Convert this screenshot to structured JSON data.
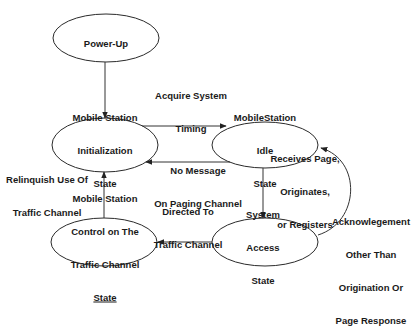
{
  "states": {
    "power_up": {
      "lines": [
        "Power-Up"
      ]
    },
    "init": {
      "lines": [
        "Mobile Station",
        "Initialization",
        "State"
      ]
    },
    "idle": {
      "lines": [
        "MobileStation",
        "Idle",
        "State"
      ]
    },
    "access": {
      "lines": [
        "System",
        "Access",
        "State"
      ]
    },
    "control": {
      "lines": [
        "Mobile Station",
        "Control on The",
        "Traffic Channel",
        "State"
      ]
    }
  },
  "transitions": {
    "acquire": {
      "lines": [
        "Acquire System",
        "Timing"
      ]
    },
    "no_message": {
      "lines": [
        "No Message",
        "On Paging Channel"
      ]
    },
    "receives": {
      "lines": [
        "Receives Page,",
        "Originates,",
        "or Registers"
      ]
    },
    "directed": {
      "lines": [
        "Directed To",
        "Traffic Channel"
      ]
    },
    "relinquish": {
      "lines": [
        "Relinquish Use Of",
        "Traffic Channel"
      ]
    },
    "ack": {
      "lines": [
        "Acknowlegement",
        "Other Than",
        "Origination Or",
        "Page Response"
      ]
    }
  },
  "colors": {
    "line": "#333333",
    "text": "#1a1a1a",
    "background": "#ffffff"
  }
}
